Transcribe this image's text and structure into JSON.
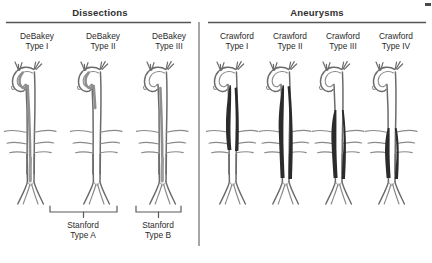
{
  "figure": {
    "title_alt": "Classification of aortic dissections and thoracoabdominal aortic aneurysms",
    "background_color": "#ffffff",
    "ink_color": "#4a4a4a",
    "lesion_fill_color": "#2b2b2b"
  },
  "sections": [
    {
      "id": "dissections",
      "heading": "Dissections",
      "rule_color": "#555555"
    },
    {
      "id": "aneurysms",
      "heading": "Aneurysms",
      "rule_color": "#555555"
    }
  ],
  "columns": [
    {
      "id": "debakey-1",
      "group": "dissections",
      "line1": "DeBakey",
      "line2": "Type I"
    },
    {
      "id": "debakey-2",
      "group": "dissections",
      "line1": "DeBakey",
      "line2": "Type II"
    },
    {
      "id": "debakey-3",
      "group": "dissections",
      "line1": "DeBakey",
      "line2": "Type III"
    },
    {
      "id": "crawford-1",
      "group": "aneurysms",
      "line1": "Crawford",
      "line2": "Type I"
    },
    {
      "id": "crawford-2",
      "group": "aneurysms",
      "line1": "Crawford",
      "line2": "Type II"
    },
    {
      "id": "crawford-3",
      "group": "aneurysms",
      "line1": "Crawford",
      "line2": "Type III"
    },
    {
      "id": "crawford-4",
      "group": "aneurysms",
      "line1": "Crawford",
      "line2": "Type IV"
    }
  ],
  "brackets": [
    {
      "id": "stanford-a",
      "line1": "Stanford",
      "line2": "Type A",
      "spans": [
        "debakey-1",
        "debakey-2"
      ]
    },
    {
      "id": "stanford-b",
      "line1": "Stanford",
      "line2": "Type B",
      "spans": [
        "debakey-3"
      ]
    }
  ]
}
